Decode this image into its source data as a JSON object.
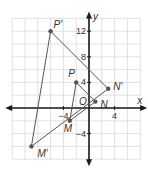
{
  "diagram": {
    "type": "coordinate-plane-dilation",
    "axes": {
      "x_label": "x",
      "y_label": "y",
      "origin_label": "O",
      "x_range": [
        -12,
        8
      ],
      "y_range": [
        -8,
        14
      ],
      "grid_step": 2,
      "x_tick_labels": [
        {
          "value": -4,
          "text": "−4"
        },
        {
          "value": 4,
          "text": "4"
        }
      ],
      "y_tick_labels": [
        {
          "value": 12,
          "text": "12"
        },
        {
          "value": 8,
          "text": "8"
        },
        {
          "value": 4,
          "text": "4"
        },
        {
          "value": -4,
          "text": "−4"
        }
      ]
    },
    "original_triangle": {
      "points": [
        {
          "label": "P",
          "x": -2,
          "y": 4
        },
        {
          "label": "N",
          "x": 1,
          "y": 1
        },
        {
          "label": "M",
          "x": -3,
          "y": -2
        }
      ]
    },
    "image_triangle": {
      "points": [
        {
          "label": "P′",
          "x": -6,
          "y": 12
        },
        {
          "label": "N′",
          "x": 3,
          "y": 3
        },
        {
          "label": "M′",
          "x": -9,
          "y": -6
        }
      ]
    },
    "colors": {
      "grid": "#d9d9d9",
      "axis": "#1a1a1a",
      "line": "#555555",
      "point": "#555555",
      "text": "#333333"
    }
  }
}
